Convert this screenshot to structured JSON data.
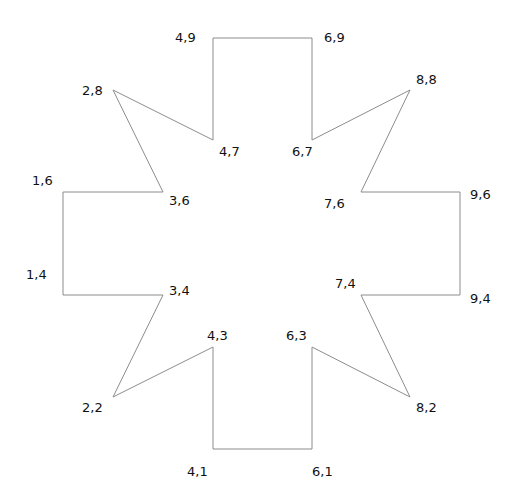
{
  "diagram": {
    "type": "polygon-star",
    "stroke_color": "#8c8c8c",
    "label_color": "#111111",
    "background": "#ffffff",
    "vertices": [
      {
        "label": "4,9",
        "x": 4,
        "y": 9,
        "px": 213,
        "py": 38,
        "lx": 175,
        "ly": 42
      },
      {
        "label": "6,9",
        "x": 6,
        "y": 9,
        "px": 312,
        "py": 38,
        "lx": 324,
        "ly": 42
      },
      {
        "label": "6,7",
        "x": 6,
        "y": 7,
        "px": 312,
        "py": 140,
        "lx": 292,
        "ly": 156
      },
      {
        "label": "8,8",
        "x": 8,
        "y": 8,
        "px": 410,
        "py": 90,
        "lx": 416,
        "ly": 84
      },
      {
        "label": "7,6",
        "x": 7,
        "y": 6,
        "px": 361,
        "py": 192,
        "lx": 324,
        "ly": 208
      },
      {
        "label": "9,6",
        "x": 9,
        "y": 6,
        "px": 460,
        "py": 192,
        "lx": 470,
        "ly": 199
      },
      {
        "label": "9,4",
        "x": 9,
        "y": 4,
        "px": 460,
        "py": 295,
        "lx": 470,
        "ly": 303
      },
      {
        "label": "7,4",
        "x": 7,
        "y": 4,
        "px": 361,
        "py": 295,
        "lx": 335,
        "ly": 288
      },
      {
        "label": "8,2",
        "x": 8,
        "y": 2,
        "px": 410,
        "py": 397,
        "lx": 416,
        "ly": 412
      },
      {
        "label": "6,3",
        "x": 6,
        "y": 3,
        "px": 312,
        "py": 347,
        "lx": 286,
        "ly": 340
      },
      {
        "label": "6,1",
        "x": 6,
        "y": 1,
        "px": 312,
        "py": 449,
        "lx": 312,
        "ly": 476
      },
      {
        "label": "4,1",
        "x": 4,
        "y": 1,
        "px": 213,
        "py": 449,
        "lx": 187,
        "ly": 476
      },
      {
        "label": "4,3",
        "x": 4,
        "y": 3,
        "px": 213,
        "py": 347,
        "lx": 207,
        "ly": 340
      },
      {
        "label": "2,2",
        "x": 2,
        "y": 2,
        "px": 113,
        "py": 397,
        "lx": 82,
        "ly": 412
      },
      {
        "label": "3,4",
        "x": 3,
        "y": 4,
        "px": 163,
        "py": 295,
        "lx": 169,
        "ly": 295
      },
      {
        "label": "1,4",
        "x": 1,
        "y": 4,
        "px": 63,
        "py": 295,
        "lx": 26,
        "ly": 279
      },
      {
        "label": "1,6",
        "x": 1,
        "y": 6,
        "px": 63,
        "py": 192,
        "lx": 32,
        "ly": 185
      },
      {
        "label": "3,6",
        "x": 3,
        "y": 6,
        "px": 163,
        "py": 192,
        "lx": 169,
        "ly": 205
      },
      {
        "label": "2,8",
        "x": 2,
        "y": 8,
        "px": 113,
        "py": 90,
        "lx": 82,
        "ly": 95
      },
      {
        "label": "4,7",
        "x": 4,
        "y": 7,
        "px": 213,
        "py": 140,
        "lx": 219,
        "ly": 156
      }
    ]
  }
}
